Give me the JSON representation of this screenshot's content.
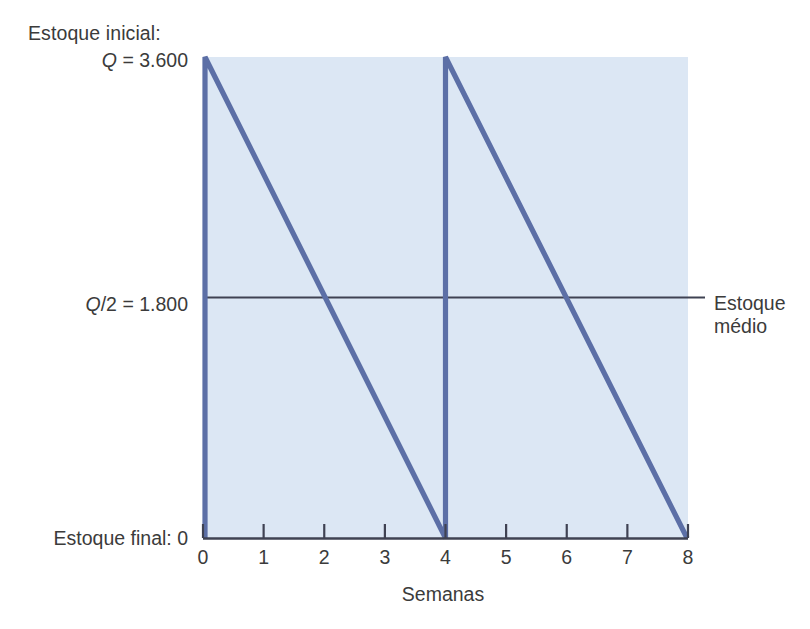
{
  "chart_data": {
    "type": "line",
    "title": "",
    "subtitle": "",
    "xlabel": "Semanas",
    "ylabel": "",
    "xlim": [
      0,
      8
    ],
    "ylim": [
      0,
      3600
    ],
    "grid": false,
    "legend_position": "right-annotation",
    "x_ticks": [
      0,
      1,
      2,
      3,
      4,
      5,
      6,
      7,
      8
    ],
    "x_tick_labels": [
      "0",
      "1",
      "2",
      "3",
      "4",
      "5",
      "6",
      "7",
      "8"
    ],
    "y_annotations": [
      {
        "value": 3600,
        "label_line1": "Estoque inicial:",
        "label_line2": "Q = 3.600"
      },
      {
        "value": 1800,
        "label_line1": "Q/2 = 1.800",
        "label_line2": ""
      },
      {
        "value": 0,
        "label_line1": "Estoque final: 0",
        "label_line2": ""
      }
    ],
    "series": [
      {
        "name": "Nivel de estoque",
        "type": "sawtooth",
        "color": "#5c6fa6",
        "points": [
          {
            "x": 0,
            "y": 0
          },
          {
            "x": 0,
            "y": 3600
          },
          {
            "x": 4,
            "y": 0
          },
          {
            "x": 4,
            "y": 3600
          },
          {
            "x": 8,
            "y": 0
          }
        ]
      },
      {
        "name": "Estoque medio",
        "type": "hline",
        "color": "#3f4252",
        "y": 1800,
        "points": [
          {
            "x": 0,
            "y": 1800
          },
          {
            "x": 8,
            "y": 1800
          }
        ]
      }
    ],
    "cycle_weeks": 4,
    "cycles": 2,
    "fill_color": "#dce7f4",
    "annotations": [
      {
        "text": "Estoque médio",
        "attached_to": "hline",
        "position": "right"
      }
    ]
  },
  "labels": {
    "initial_title": "Estoque inicial:",
    "initial_value": "Q = 3.600",
    "initial_value_symbol": "Q",
    "initial_value_rest": " = 3.600",
    "half_symbol": "Q",
    "half_rest": "/2 = 1.800",
    "half_value": "Q/2 = 1.800",
    "final_value": "Estoque final: 0",
    "avg_line1": "Estoque",
    "avg_line2": "médio",
    "xaxis_title": "Semanas"
  },
  "colors": {
    "plot_fill": "#dce7f4",
    "sawtooth_line": "#5c6fa6",
    "average_line": "#3f4252",
    "axis": "#3f4252",
    "text": "#3b3b3b",
    "background": "#ffffff"
  }
}
